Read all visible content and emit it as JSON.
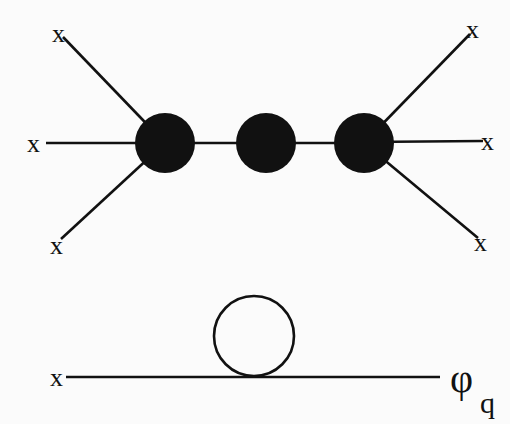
{
  "diagram": {
    "top_diagram": {
      "external_leg_labels": [
        "x",
        "x",
        "x",
        "x",
        "x",
        "x"
      ],
      "blob_count": 3,
      "blob_color": "#111111"
    },
    "bottom_diagram": {
      "left_label": "x",
      "right_label": "φ",
      "right_label_subscript": "q",
      "loop_count": 1
    },
    "colors": {
      "ink": "#111111",
      "background": "#fbfbfb"
    }
  }
}
